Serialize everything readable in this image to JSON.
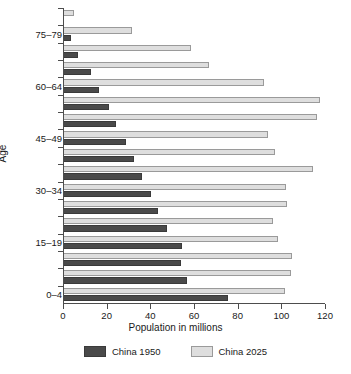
{
  "chart_data": {
    "type": "bar",
    "orientation": "horizontal",
    "title": "",
    "xlabel": "Population in millions",
    "ylabel": "Age",
    "xlim": [
      0,
      120
    ],
    "xticks": [
      0,
      20,
      40,
      60,
      80,
      100,
      120
    ],
    "xtick_labels": [
      "0",
      "20",
      "40",
      "60",
      "80",
      "100",
      "120"
    ],
    "grid": false,
    "legend_position": "bottom",
    "categories": [
      "0–4",
      "5–9",
      "10–14",
      "15–19",
      "20–24",
      "25–29",
      "30–34",
      "35–39",
      "40–44",
      "45–49",
      "50–54",
      "55–59",
      "60–64",
      "65–69",
      "70–74",
      "75–79",
      "80+"
    ],
    "ytick_labels": [
      "0–4",
      "15–19",
      "30–34",
      "45–49",
      "60–64",
      "75–79"
    ],
    "series": [
      {
        "name": "China 1950",
        "color": "#4a4a4a",
        "values": [
          75.5,
          57,
          54,
          54.5,
          47.5,
          43.5,
          40.5,
          36,
          32.5,
          29,
          24.5,
          21,
          16.5,
          13,
          7,
          3.5,
          0
        ]
      },
      {
        "name": "China 2025",
        "color": "#dedede",
        "values": [
          101.5,
          104.5,
          105,
          98.5,
          96,
          102.5,
          102,
          114.5,
          97,
          94,
          116.5,
          117.5,
          92,
          67,
          58.5,
          31.5,
          5
        ]
      }
    ]
  },
  "legend": {
    "items": [
      {
        "label": "China 1950",
        "swatch": "old"
      },
      {
        "label": "China 2025",
        "swatch": "new"
      }
    ]
  },
  "axes": {
    "x_title": "Population in millions",
    "y_title": "Age"
  }
}
